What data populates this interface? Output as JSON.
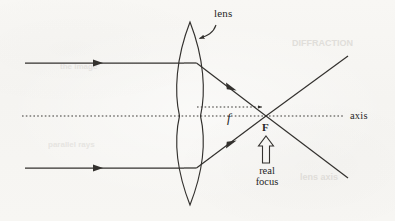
{
  "figure": {
    "kind": "optics-ray-diagram",
    "background_color": "#f7f6f3",
    "ink_color": "#33312e"
  },
  "labels": {
    "lens": "lens",
    "focal_length_symbol": "f",
    "focus_point": "F",
    "axis": "axis",
    "real_focus_line1": "real",
    "real_focus_line2": "focus"
  },
  "bleed_through": [
    {
      "text": "DIFFRACTION",
      "x": 292,
      "y": 44,
      "size": 9,
      "rotate": 0
    },
    {
      "text": "lens axis",
      "x": 300,
      "y": 178,
      "size": 9,
      "rotate": 0
    },
    {
      "text": "the image",
      "x": 60,
      "y": 68,
      "size": 8,
      "rotate": 0
    },
    {
      "text": "parallel rays",
      "x": 48,
      "y": 146,
      "size": 8,
      "rotate": 0
    }
  ],
  "geometry": {
    "lens": {
      "apex_top": {
        "x": 190,
        "y": 22
      },
      "apex_bottom": {
        "x": 190,
        "y": 205
      },
      "half_thickness_px": 10.5,
      "center_y": 116
    },
    "axis": {
      "y": 116,
      "x_start": 22,
      "x_end": 345,
      "style": "dotted",
      "label_x": 350,
      "label_y": 111
    },
    "focal_measure": {
      "y": 107,
      "x_start": 196,
      "x_end": 264,
      "style": "dotted",
      "arrowhead": "right",
      "label_x": 229,
      "label_y": 110
    },
    "focus": {
      "x": 266,
      "y": 116
    },
    "incoming_rays": [
      {
        "id": "upper",
        "y": 63,
        "x_start": 25,
        "x_end": 183,
        "arrow_x": 98
      },
      {
        "id": "lower",
        "y": 168,
        "x_start": 25,
        "x_end": 183,
        "arrow_x": 98
      }
    ],
    "refracted_rays": [
      {
        "id": "upper",
        "from": {
          "x": 196,
          "y": 63
        },
        "to": {
          "x": 266,
          "y": 116
        },
        "arrow_t": 0.52
      },
      {
        "id": "lower",
        "from": {
          "x": 196,
          "y": 168
        },
        "to": {
          "x": 266,
          "y": 116
        },
        "arrow_t": 0.52
      }
    ],
    "diverging_rays": [
      {
        "id": "upper-continues-down",
        "from": {
          "x": 266,
          "y": 116
        },
        "to": {
          "x": 348,
          "y": 178
        }
      },
      {
        "id": "lower-continues-up",
        "from": {
          "x": 266,
          "y": 116
        },
        "to": {
          "x": 348,
          "y": 56
        }
      }
    ],
    "lens_pointer": {
      "label_x": 214,
      "label_y": 14,
      "curve_start": {
        "x": 212,
        "y": 26
      },
      "curve_end": {
        "x": 196,
        "y": 39
      }
    },
    "block_arrow": {
      "tip": {
        "x": 266,
        "y": 137
      },
      "base_y": 163,
      "shaft_half_width": 3.5,
      "head_half_width": 7.5,
      "head_height": 9
    },
    "real_focus_label": {
      "x": 266,
      "y": 166
    },
    "F_label": {
      "x": 266,
      "y": 121
    }
  }
}
